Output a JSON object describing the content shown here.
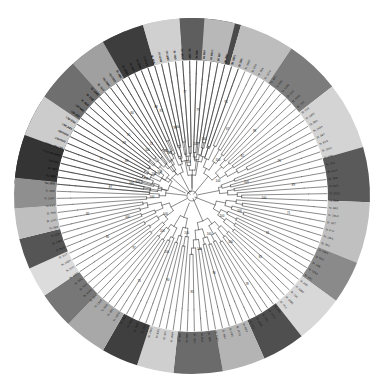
{
  "figure": {
    "name": "circular-phylogenetic-tree",
    "type": "radial-cladogram",
    "background_color": "#ffffff",
    "branch_color": "#2b2b2b",
    "center": {
      "x": 192,
      "y": 196
    },
    "inner_radius": 0,
    "tree_radius": 128,
    "ring_inner_radius": 136,
    "ring_outer_radius": 178
  },
  "ring_groups": [
    {
      "label": "group-1",
      "color": "#3a3a3a",
      "start_deg": -86,
      "end_deg": -58
    },
    {
      "label": "group-2",
      "color": "#9b9b9b",
      "start_deg": -58,
      "end_deg": -44
    },
    {
      "label": "group-3",
      "color": "#6e6e6e",
      "start_deg": -44,
      "end_deg": -22
    },
    {
      "label": "group-4",
      "color": "#c9c9c9",
      "start_deg": -22,
      "end_deg": -4
    },
    {
      "label": "group-5",
      "color": "#4a4a4a",
      "start_deg": -4,
      "end_deg": 16
    },
    {
      "label": "group-6",
      "color": "#bdbdbd",
      "start_deg": 16,
      "end_deg": 34
    },
    {
      "label": "group-7",
      "color": "#7c7c7c",
      "start_deg": 34,
      "end_deg": 52
    },
    {
      "label": "group-8",
      "color": "#d4d4d4",
      "start_deg": 52,
      "end_deg": 74
    },
    {
      "label": "group-9",
      "color": "#5a5a5a",
      "start_deg": 74,
      "end_deg": 92
    },
    {
      "label": "group-10",
      "color": "#c0c0c0",
      "start_deg": 92,
      "end_deg": 112
    },
    {
      "label": "group-11",
      "color": "#8a8a8a",
      "start_deg": 112,
      "end_deg": 126
    },
    {
      "label": "group-12",
      "color": "#d8d8d8",
      "start_deg": 126,
      "end_deg": 142
    },
    {
      "label": "group-13",
      "color": "#4f4f4f",
      "start_deg": 142,
      "end_deg": 156
    },
    {
      "label": "group-14",
      "color": "#b4b4b4",
      "start_deg": 156,
      "end_deg": 170
    },
    {
      "label": "group-15",
      "color": "#6b6b6b",
      "start_deg": 170,
      "end_deg": 186
    },
    {
      "label": "group-16",
      "color": "#cfcfcf",
      "start_deg": 186,
      "end_deg": 198
    },
    {
      "label": "group-17",
      "color": "#3f3f3f",
      "start_deg": 198,
      "end_deg": 210
    },
    {
      "label": "group-18",
      "color": "#a8a8a8",
      "start_deg": 210,
      "end_deg": 224
    },
    {
      "label": "group-19",
      "color": "#777777",
      "start_deg": 224,
      "end_deg": 236
    },
    {
      "label": "group-20",
      "color": "#dcdcdc",
      "start_deg": 236,
      "end_deg": 246
    },
    {
      "label": "group-21",
      "color": "#555555",
      "start_deg": 246,
      "end_deg": 256
    },
    {
      "label": "group-22",
      "color": "#bfbfbf",
      "start_deg": 256,
      "end_deg": 266
    },
    {
      "label": "group-23",
      "color": "#8f8f8f",
      "start_deg": 266,
      "end_deg": 276
    },
    {
      "label": "group-24",
      "color": "#343434",
      "start_deg": 276,
      "end_deg": 290
    },
    {
      "label": "group-25",
      "color": "#cccccc",
      "start_deg": 290,
      "end_deg": 304
    },
    {
      "label": "group-26",
      "color": "#6f6f6f",
      "start_deg": 304,
      "end_deg": 318
    },
    {
      "label": "group-27",
      "color": "#a0a0a0",
      "start_deg": 318,
      "end_deg": 330
    },
    {
      "label": "group-28",
      "color": "#3d3d3d",
      "start_deg": 330,
      "end_deg": 344
    },
    {
      "label": "group-29",
      "color": "#d0d0d0",
      "start_deg": 344,
      "end_deg": 356
    },
    {
      "label": "group-30",
      "color": "#5e5e5e",
      "start_deg": 356,
      "end_deg": 364
    },
    {
      "label": "group-31",
      "color": "#b8b8b8",
      "start_deg": 364,
      "end_deg": 274
    }
  ],
  "tips": [
    {
      "label": "St. 137/5",
      "angle_deg": -85
    },
    {
      "label": "St. 1A/3",
      "angle_deg": -82
    },
    {
      "label": "St. 16/2",
      "angle_deg": -79
    },
    {
      "label": "St. 144/1",
      "angle_deg": -76
    },
    {
      "label": "St. 149/3",
      "angle_deg": -73
    },
    {
      "label": "St. 12/4",
      "angle_deg": -70
    },
    {
      "label": "St. 1B/7",
      "angle_deg": -67
    },
    {
      "label": "St. 107/2",
      "angle_deg": -64
    },
    {
      "label": "St. 33/1",
      "angle_deg": -61
    },
    {
      "label": "St. 81/4",
      "angle_deg": -58
    },
    {
      "label": "St. 65/2",
      "angle_deg": -55
    },
    {
      "label": "St. 44/6",
      "angle_deg": -52
    },
    {
      "label": "St. 91/3",
      "angle_deg": -49
    },
    {
      "label": "St. 27/5",
      "angle_deg": -46
    },
    {
      "label": "St. 118/1",
      "angle_deg": -43
    },
    {
      "label": "St. 73/2",
      "angle_deg": -40
    },
    {
      "label": "St. 56/4",
      "angle_deg": -37
    },
    {
      "label": "St. 102/3",
      "angle_deg": -34
    },
    {
      "label": "St. 38/1",
      "angle_deg": -31
    },
    {
      "label": "St. 125/6",
      "angle_deg": -28
    },
    {
      "label": "St. 19/2",
      "angle_deg": -25
    },
    {
      "label": "St. 88/5",
      "angle_deg": -22
    },
    {
      "label": "St. 141/3",
      "angle_deg": -19
    },
    {
      "label": "St. 61/1",
      "angle_deg": -16
    },
    {
      "label": "St. 24/4",
      "angle_deg": -13
    },
    {
      "label": "St. 113/2",
      "angle_deg": -10
    },
    {
      "label": "St. 77/6",
      "angle_deg": -7
    },
    {
      "label": "St. 35/3",
      "angle_deg": -4
    },
    {
      "label": "St. 129/5",
      "angle_deg": -1
    },
    {
      "label": "St. 52/1",
      "angle_deg": 2
    },
    {
      "label": "St. 96/4",
      "angle_deg": 5
    },
    {
      "label": "St. 147/2",
      "angle_deg": 8
    },
    {
      "label": "St. 41/7",
      "angle_deg": 11
    },
    {
      "label": "St. 84/3",
      "angle_deg": 14
    },
    {
      "label": "St. 133/1",
      "angle_deg": 17
    },
    {
      "label": "St. 29/5",
      "angle_deg": 20
    },
    {
      "label": "St. 108/2",
      "angle_deg": 23
    },
    {
      "label": "St. 67/4",
      "angle_deg": 26
    },
    {
      "label": "St. 15/6",
      "angle_deg": 29
    },
    {
      "label": "St. 121/3",
      "angle_deg": 32
    },
    {
      "label": "St. 49/1",
      "angle_deg": 35
    },
    {
      "label": "St. 93/5",
      "angle_deg": 38
    },
    {
      "label": "St. 139/2",
      "angle_deg": 41
    },
    {
      "label": "St. 22/4",
      "angle_deg": 44
    },
    {
      "label": "St. 105/6",
      "angle_deg": 47
    },
    {
      "label": "St. 71/3",
      "angle_deg": 50
    },
    {
      "label": "St. 31/1",
      "angle_deg": 53
    },
    {
      "label": "St. 116/5",
      "angle_deg": 56
    },
    {
      "label": "St. 58/2",
      "angle_deg": 59
    },
    {
      "label": "St. 143/4",
      "angle_deg": 62
    },
    {
      "label": "St. 18/7",
      "angle_deg": 65
    },
    {
      "label": "St. 87/3",
      "angle_deg": 68
    },
    {
      "label": "St. 126/1",
      "angle_deg": 71
    },
    {
      "label": "St. 64/5",
      "angle_deg": 74
    },
    {
      "label": "St. 37/2",
      "angle_deg": 77
    },
    {
      "label": "St. 111/4",
      "angle_deg": 80
    },
    {
      "label": "St. 79/6",
      "angle_deg": 83
    },
    {
      "label": "St. 26/3",
      "angle_deg": 86
    },
    {
      "label": "St. 131/1",
      "angle_deg": 89
    },
    {
      "label": "St. 54/5",
      "angle_deg": 92
    },
    {
      "label": "St. 98/2",
      "angle_deg": 95
    },
    {
      "label": "St. 145/4",
      "angle_deg": 98
    },
    {
      "label": "St. 43/7",
      "angle_deg": 101
    },
    {
      "label": "St. 82/3",
      "angle_deg": 104
    },
    {
      "label": "St. 135/1",
      "angle_deg": 107
    },
    {
      "label": "St. 20/5",
      "angle_deg": 110
    },
    {
      "label": "St. 109/2",
      "angle_deg": 113
    },
    {
      "label": "St. 69/4",
      "angle_deg": 116
    },
    {
      "label": "St. 13/6",
      "angle_deg": 119
    },
    {
      "label": "St. 123/3",
      "angle_deg": 122
    },
    {
      "label": "St. 47/1",
      "angle_deg": 125
    },
    {
      "label": "St. 95/5",
      "angle_deg": 128
    },
    {
      "label": "St. 138/2",
      "angle_deg": 131
    },
    {
      "label": "St. 23/4",
      "angle_deg": 134
    },
    {
      "label": "St. 103/6",
      "angle_deg": 137
    },
    {
      "label": "St. 72/3",
      "angle_deg": 140
    },
    {
      "label": "St. 32/1",
      "angle_deg": 143
    },
    {
      "label": "St. 117/5",
      "angle_deg": 146
    },
    {
      "label": "St. 59/2",
      "angle_deg": 149
    },
    {
      "label": "St. 142/4",
      "angle_deg": 152
    },
    {
      "label": "St. 17/7",
      "angle_deg": 155
    },
    {
      "label": "St. 86/3",
      "angle_deg": 158
    },
    {
      "label": "St. 127/1",
      "angle_deg": 161
    },
    {
      "label": "St. 63/5",
      "angle_deg": 164
    },
    {
      "label": "St. 36/2",
      "angle_deg": 167
    },
    {
      "label": "St. 112/4",
      "angle_deg": 170
    },
    {
      "label": "St. 78/6",
      "angle_deg": 173
    },
    {
      "label": "St. 25/3",
      "angle_deg": 176
    },
    {
      "label": "St. 132/1",
      "angle_deg": 179
    },
    {
      "label": "St. 55/5",
      "angle_deg": 182
    },
    {
      "label": "St. 99/2",
      "angle_deg": 185
    },
    {
      "label": "St. 146/4",
      "angle_deg": 188
    },
    {
      "label": "St. 42/7",
      "angle_deg": 191
    },
    {
      "label": "St. 83/3",
      "angle_deg": 194
    },
    {
      "label": "St. 134/1",
      "angle_deg": 197
    },
    {
      "label": "St. 21/5",
      "angle_deg": 200
    },
    {
      "label": "St. 110/2",
      "angle_deg": 203
    },
    {
      "label": "St. 68/4",
      "angle_deg": 206
    },
    {
      "label": "St. 14/6",
      "angle_deg": 209
    },
    {
      "label": "St. 122/3",
      "angle_deg": 212
    },
    {
      "label": "St. 48/1",
      "angle_deg": 215
    },
    {
      "label": "St. 94/5",
      "angle_deg": 218
    },
    {
      "label": "St. 136/2",
      "angle_deg": 221
    },
    {
      "label": "St. 28/4",
      "angle_deg": 224
    },
    {
      "label": "St. 104/6",
      "angle_deg": 227
    },
    {
      "label": "St. 74/3",
      "angle_deg": 230
    },
    {
      "label": "St. 30/1",
      "angle_deg": 233
    },
    {
      "label": "St. 119/5",
      "angle_deg": 236
    },
    {
      "label": "St. 57/2",
      "angle_deg": 239
    },
    {
      "label": "St. 140/4",
      "angle_deg": 242
    },
    {
      "label": "St. 1C/7",
      "angle_deg": 245
    },
    {
      "label": "St. 85/3",
      "angle_deg": 248
    },
    {
      "label": "St. 128/1",
      "angle_deg": 251
    },
    {
      "label": "St. 62/5",
      "angle_deg": 254
    },
    {
      "label": "St. 39/2",
      "angle_deg": 257
    },
    {
      "label": "St. 114/4",
      "angle_deg": 260
    },
    {
      "label": "St. 76/6",
      "angle_deg": 263
    },
    {
      "label": "St. 34/3",
      "angle_deg": 266
    },
    {
      "label": "St. 130/1",
      "angle_deg": 269
    },
    {
      "label": "St. 53/5",
      "angle_deg": 272
    },
    {
      "label": "St. 97/2",
      "angle_deg": 275
    },
    {
      "label": "St. 148/4",
      "angle_deg": 278
    },
    {
      "label": "St. 40/7",
      "angle_deg": 281
    },
    {
      "label": "St. 80/3",
      "angle_deg": 284
    },
    {
      "label": "Outgroup sp. 01",
      "angle_deg": 287
    },
    {
      "label": "Outgroup sp. 02",
      "angle_deg": 290
    },
    {
      "label": "CN/PV-01",
      "angle_deg": 293
    },
    {
      "label": "CN/PV-02",
      "angle_deg": 296
    },
    {
      "label": "CN/13-03",
      "angle_deg": 299
    },
    {
      "label": "CN/12-04",
      "angle_deg": 302
    },
    {
      "label": "CJ/F1/05",
      "angle_deg": 305
    },
    {
      "label": "CJ/F1/06",
      "angle_deg": 308
    },
    {
      "label": "St. 46/1",
      "angle_deg": 311
    },
    {
      "label": "St. 90/5",
      "angle_deg": 314
    },
    {
      "label": "St. 124/2",
      "angle_deg": 317
    },
    {
      "label": "St. 11/4",
      "angle_deg": 320
    },
    {
      "label": "St. 101/6",
      "angle_deg": 323
    },
    {
      "label": "St. 70/3",
      "angle_deg": 326
    },
    {
      "label": "St. 10/1",
      "angle_deg": 329
    },
    {
      "label": "St. 115/5",
      "angle_deg": 332
    },
    {
      "label": "St. 60/2",
      "angle_deg": 335
    },
    {
      "label": "St. 150/4",
      "angle_deg": 338
    },
    {
      "label": "St. 9/7",
      "angle_deg": 341
    },
    {
      "label": "St. 89/3",
      "angle_deg": 344
    },
    {
      "label": "St. 120/1",
      "angle_deg": 347
    },
    {
      "label": "St. 66/5",
      "angle_deg": 350
    },
    {
      "label": "St. 45/2",
      "angle_deg": 353
    },
    {
      "label": "St. 106/4",
      "angle_deg": 356
    },
    {
      "label": "St. 75/6",
      "angle_deg": 359
    },
    {
      "label": "St. 8/3",
      "angle_deg": 362
    },
    {
      "label": "St. 7/1",
      "angle_deg": 365
    },
    {
      "label": "St. 6/5",
      "angle_deg": 368
    },
    {
      "label": "St. 5/2",
      "angle_deg": 371
    },
    {
      "label": "St. 4/4",
      "angle_deg": 374
    },
    {
      "label": "St. 3/6",
      "angle_deg": 377
    },
    {
      "label": "St. 2/3",
      "angle_deg": 380
    }
  ],
  "support_values": [
    {
      "value": "100",
      "angle_deg": -78,
      "radius": 62
    },
    {
      "value": "99",
      "angle_deg": -70,
      "radius": 48
    },
    {
      "value": "86",
      "angle_deg": -62,
      "radius": 74
    },
    {
      "value": "100",
      "angle_deg": -54,
      "radius": 40
    },
    {
      "value": "95",
      "angle_deg": -46,
      "radius": 88
    },
    {
      "value": "74",
      "angle_deg": -38,
      "radius": 66
    },
    {
      "value": "100",
      "angle_deg": -30,
      "radius": 52
    },
    {
      "value": "88",
      "angle_deg": -22,
      "radius": 96
    },
    {
      "value": "93",
      "angle_deg": -14,
      "radius": 70
    },
    {
      "value": "100",
      "angle_deg": -6,
      "radius": 34
    },
    {
      "value": "79",
      "angle_deg": 4,
      "radius": 86
    },
    {
      "value": "100",
      "angle_deg": 12,
      "radius": 58
    },
    {
      "value": "91",
      "angle_deg": 20,
      "radius": 100
    },
    {
      "value": "67",
      "angle_deg": 28,
      "radius": 76
    },
    {
      "value": "100",
      "angle_deg": 36,
      "radius": 44
    },
    {
      "value": "98",
      "angle_deg": 44,
      "radius": 90
    },
    {
      "value": "82",
      "angle_deg": 52,
      "radius": 64
    },
    {
      "value": "100",
      "angle_deg": 60,
      "radius": 30
    },
    {
      "value": "76",
      "angle_deg": 68,
      "radius": 94
    },
    {
      "value": "100",
      "angle_deg": 76,
      "radius": 56
    },
    {
      "value": "89",
      "angle_deg": 84,
      "radius": 102
    },
    {
      "value": "100",
      "angle_deg": 92,
      "radius": 72
    },
    {
      "value": "71",
      "angle_deg": 100,
      "radius": 98
    },
    {
      "value": "100",
      "angle_deg": 108,
      "radius": 50
    },
    {
      "value": "94",
      "angle_deg": 116,
      "radius": 84
    },
    {
      "value": "100",
      "angle_deg": 124,
      "radius": 36
    },
    {
      "value": "85",
      "angle_deg": 132,
      "radius": 92
    },
    {
      "value": "100",
      "angle_deg": 140,
      "radius": 60
    },
    {
      "value": "78",
      "angle_deg": 148,
      "radius": 104
    },
    {
      "value": "100",
      "angle_deg": 156,
      "radius": 42
    },
    {
      "value": "96",
      "angle_deg": 164,
      "radius": 80
    },
    {
      "value": "100",
      "angle_deg": 172,
      "radius": 54
    },
    {
      "value": "83",
      "angle_deg": 180,
      "radius": 96
    },
    {
      "value": "100",
      "angle_deg": 188,
      "radius": 38
    },
    {
      "value": "90",
      "angle_deg": 196,
      "radius": 88
    },
    {
      "value": "100",
      "angle_deg": 204,
      "radius": 62
    },
    {
      "value": "73",
      "angle_deg": 212,
      "radius": 100
    },
    {
      "value": "100",
      "angle_deg": 220,
      "radius": 46
    },
    {
      "value": "97",
      "angle_deg": 228,
      "radius": 78
    },
    {
      "value": "100",
      "angle_deg": 236,
      "radius": 32
    },
    {
      "value": "80",
      "angle_deg": 244,
      "radius": 94
    },
    {
      "value": "100",
      "angle_deg": 252,
      "radius": 68
    },
    {
      "value": "92",
      "angle_deg": 260,
      "radius": 106
    },
    {
      "value": "100",
      "angle_deg": 268,
      "radius": 40
    },
    {
      "value": "87",
      "angle_deg": 276,
      "radius": 82
    },
    {
      "value": "100",
      "angle_deg": 284,
      "radius": 56
    },
    {
      "value": "75",
      "angle_deg": 292,
      "radius": 98
    },
    {
      "value": "100",
      "angle_deg": 300,
      "radius": 44
    },
    {
      "value": "99",
      "angle_deg": 308,
      "radius": 86
    },
    {
      "value": "100",
      "angle_deg": 316,
      "radius": 64
    },
    {
      "value": "84",
      "angle_deg": 324,
      "radius": 102
    },
    {
      "value": "100",
      "angle_deg": 332,
      "radius": 48
    },
    {
      "value": "93",
      "angle_deg": 340,
      "radius": 90
    },
    {
      "value": "100",
      "angle_deg": 348,
      "radius": 70
    },
    {
      "value": "77",
      "angle_deg": 356,
      "radius": 104
    },
    {
      "value": "100",
      "angle_deg": 364,
      "radius": 52
    }
  ]
}
